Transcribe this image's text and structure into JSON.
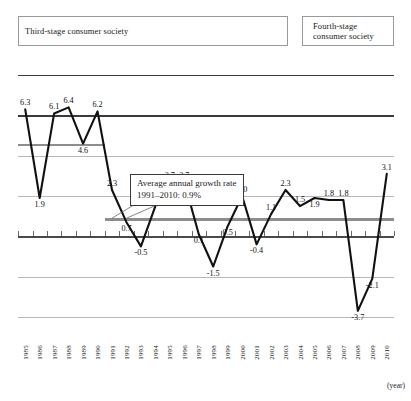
{
  "stages": {
    "third": "Third-stage consumer society",
    "fourth": "Fourth-stage\nconsumer society"
  },
  "annotation": {
    "line1": "Average annual growth rate",
    "line2": "1991–2010: 0.9%"
  },
  "axis": {
    "unit_label": "(year)"
  },
  "chart_data": {
    "type": "line",
    "title": "",
    "xlabel": "(year)",
    "ylabel": "",
    "grid": true,
    "legend": "none",
    "ylim": [
      -5,
      9
    ],
    "categories": [
      "1985",
      "1986",
      "1987",
      "1988",
      "1989",
      "1990",
      "1991",
      "1992",
      "1993",
      "1994",
      "1995",
      "1996",
      "1997",
      "1998",
      "1999",
      "2000",
      "2001",
      "2002",
      "2003",
      "2004",
      "2005",
      "2006",
      "2007",
      "2008",
      "2009",
      "2010"
    ],
    "values": [
      6.3,
      1.9,
      6.1,
      6.4,
      4.6,
      6.2,
      2.3,
      0.7,
      -0.5,
      1.5,
      2.7,
      2.7,
      0.1,
      -1.5,
      0.5,
      2.0,
      -0.4,
      1.1,
      2.3,
      1.5,
      1.9,
      1.8,
      1.8,
      -3.7,
      -2.1,
      3.1
    ],
    "labels": [
      "6.3",
      "1.9",
      "6.1",
      "6.4",
      "4.6",
      "6.2",
      "2.3",
      "0.7",
      "-0.5",
      "1.5",
      "2.7",
      "2.7",
      "0.1",
      "-1.5",
      "0.5",
      "2.0",
      "-0.4",
      "1.1",
      "2.3",
      "1.5",
      "1.9",
      "1.8",
      "1.8",
      "-3.7",
      "-2.1",
      "3.1"
    ],
    "annotations": [
      {
        "name": "avg-1985-1990",
        "value": 4.6,
        "from": "1985",
        "to": "1990",
        "label": "4.6"
      },
      {
        "name": "avg-1991-2010",
        "value": 0.9,
        "from": "1991",
        "to": "2010",
        "label": "Average annual growth rate 1991–2010: 0.9%"
      }
    ]
  }
}
